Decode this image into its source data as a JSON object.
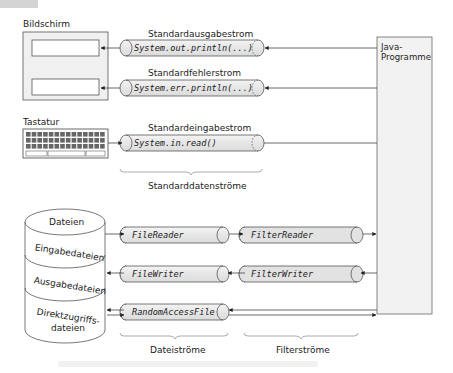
{
  "corner_tab": {
    "color": "#cfcfcf"
  },
  "screen": {
    "title": "Bildschirm"
  },
  "keyboard": {
    "title": "Tastatur"
  },
  "java_box": {
    "line1": "Java-",
    "line2": "Programme"
  },
  "standard_streams": [
    {
      "title": "Standardausgabestrom",
      "code": "System.out.println(...)",
      "direction": "to-screen"
    },
    {
      "title": "Standardfehlerstrom",
      "code": "System.err.println(...)",
      "direction": "to-screen"
    },
    {
      "title": "Standardeingabestrom",
      "code": "System.in.read()",
      "direction": "from-keyboard"
    }
  ],
  "standard_group_label": "Standarddatenströme",
  "database": {
    "top": "Dateien",
    "sections": [
      "Eingabedateien",
      "Ausgabedateien",
      "Direktzugriffs-",
      "dateien"
    ]
  },
  "file_streams": [
    {
      "code": "FileReader"
    },
    {
      "code": "FileWriter"
    },
    {
      "code": "RandomAccessFile"
    }
  ],
  "filter_streams": [
    {
      "code": "FilterReader"
    },
    {
      "code": "FilterWriter"
    }
  ],
  "group_labels": {
    "file": "Dateiströme",
    "filter": "Filterströme"
  },
  "colors": {
    "stream_fill": "#e8e8e8",
    "java_fill": "#f2f2f2",
    "stroke": "#555555"
  }
}
